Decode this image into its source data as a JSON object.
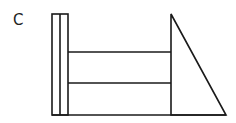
{
  "figure": {
    "label": "C",
    "stroke_color": "#1a1a1a",
    "background": "#ffffff",
    "shapes": {
      "vertical_post": {
        "x": 52,
        "y": 14,
        "width": 16,
        "height": 101,
        "divider_x": 60
      },
      "rail_upper_y": 52,
      "rail_lower_y": 83,
      "rail_x_start": 68,
      "rail_x_end": 171,
      "triangle": {
        "apex": [
          171,
          14
        ],
        "base_left": [
          171,
          115
        ],
        "base_right": [
          226,
          115
        ]
      },
      "base_line": {
        "x1": 52,
        "x2": 226,
        "y": 115
      }
    }
  }
}
